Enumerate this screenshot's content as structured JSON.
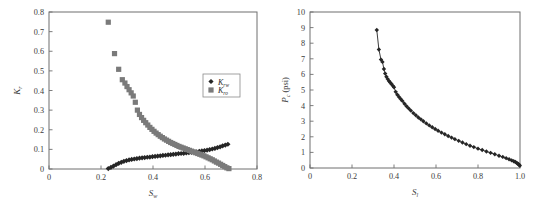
{
  "figure": {
    "background_color": "#ffffff",
    "panel_count": 2
  },
  "chart_data": [
    {
      "panel": "left",
      "type": "scatter",
      "title": "",
      "xlabel": "S_w",
      "xlabel_base": "S",
      "xlabel_sub": "w",
      "ylabel": "K_r",
      "ylabel_base": "K",
      "ylabel_sub": "r",
      "xlim": [
        0,
        0.8
      ],
      "ylim": [
        0,
        0.8
      ],
      "xticks": [
        0,
        0.2,
        0.4,
        0.6,
        0.8
      ],
      "xtick_labels": [
        "0",
        "0.2",
        "0.4",
        "0.6",
        "0.8"
      ],
      "yticks": [
        0,
        0.1,
        0.2,
        0.3,
        0.4,
        0.5,
        0.6,
        0.7,
        0.8
      ],
      "ytick_labels": [
        "0",
        "0.1",
        "0.2",
        "0.3",
        "0.4",
        "0.5",
        "0.6",
        "0.7",
        "0.8"
      ],
      "grid": false,
      "legend_position": "center-right",
      "series": [
        {
          "name": "K_rw",
          "name_base": "K",
          "name_sub": "rw",
          "marker": "diamond",
          "color": "#262626",
          "marker_size": 2.6,
          "x": [
            0.228,
            0.238,
            0.248,
            0.258,
            0.268,
            0.278,
            0.288,
            0.298,
            0.308,
            0.318,
            0.328,
            0.338,
            0.348,
            0.358,
            0.368,
            0.378,
            0.388,
            0.398,
            0.408,
            0.418,
            0.428,
            0.438,
            0.448,
            0.458,
            0.468,
            0.478,
            0.488,
            0.498,
            0.508,
            0.518,
            0.528,
            0.538,
            0.548,
            0.558,
            0.568,
            0.578,
            0.588,
            0.598,
            0.608,
            0.618,
            0.628,
            0.638,
            0.648,
            0.658,
            0.668,
            0.678,
            0.688
          ],
          "y": [
            0.002,
            0.008,
            0.015,
            0.022,
            0.029,
            0.034,
            0.039,
            0.043,
            0.046,
            0.049,
            0.051,
            0.053,
            0.055,
            0.057,
            0.058,
            0.06,
            0.061,
            0.063,
            0.064,
            0.066,
            0.067,
            0.069,
            0.07,
            0.072,
            0.073,
            0.075,
            0.076,
            0.078,
            0.079,
            0.08,
            0.082,
            0.083,
            0.085,
            0.086,
            0.088,
            0.09,
            0.092,
            0.094,
            0.096,
            0.099,
            0.102,
            0.105,
            0.109,
            0.113,
            0.118,
            0.122,
            0.126
          ]
        },
        {
          "name": "K_ro",
          "name_base": "K",
          "name_sub": "ro",
          "marker": "square",
          "color": "#7a7a7a",
          "marker_size": 2.6,
          "x": [
            0.228,
            0.252,
            0.268,
            0.282,
            0.292,
            0.3,
            0.308,
            0.316,
            0.324,
            0.332,
            0.34,
            0.348,
            0.356,
            0.364,
            0.372,
            0.38,
            0.388,
            0.396,
            0.404,
            0.412,
            0.42,
            0.428,
            0.436,
            0.444,
            0.452,
            0.46,
            0.468,
            0.476,
            0.484,
            0.492,
            0.5,
            0.508,
            0.516,
            0.524,
            0.532,
            0.54,
            0.548,
            0.556,
            0.564,
            0.572,
            0.58,
            0.588,
            0.596,
            0.604,
            0.612,
            0.62,
            0.628,
            0.636,
            0.644,
            0.652,
            0.66,
            0.668,
            0.676,
            0.684,
            0.692
          ],
          "y": [
            0.748,
            0.588,
            0.508,
            0.455,
            0.438,
            0.42,
            0.404,
            0.388,
            0.372,
            0.34,
            0.3,
            0.278,
            0.262,
            0.248,
            0.236,
            0.224,
            0.212,
            0.202,
            0.192,
            0.183,
            0.175,
            0.167,
            0.16,
            0.153,
            0.147,
            0.141,
            0.135,
            0.13,
            0.125,
            0.12,
            0.115,
            0.111,
            0.107,
            0.103,
            0.099,
            0.095,
            0.091,
            0.087,
            0.083,
            0.079,
            0.075,
            0.071,
            0.067,
            0.062,
            0.057,
            0.052,
            0.047,
            0.041,
            0.035,
            0.03,
            0.024,
            0.018,
            0.012,
            0.006,
            0.002
          ]
        }
      ]
    },
    {
      "panel": "right",
      "type": "line",
      "title": "",
      "xlabel": "S_l",
      "xlabel_base": "S",
      "xlabel_sub": "l",
      "ylabel": "P_c (psi)",
      "ylabel_base": "P",
      "ylabel_sub": "c",
      "ylabel_unit": "(psi)",
      "xlim": [
        0,
        1.0
      ],
      "ylim": [
        0,
        10
      ],
      "xticks": [
        0,
        0.2,
        0.4,
        0.6,
        0.8,
        1.0
      ],
      "xtick_labels": [
        "0",
        "0.2",
        "0.4",
        "0.6",
        "0.8",
        "1.0"
      ],
      "yticks": [
        0,
        1,
        2,
        3,
        4,
        5,
        6,
        7,
        8,
        9,
        10
      ],
      "ytick_labels": [
        "0",
        "1",
        "2",
        "3",
        "4",
        "5",
        "6",
        "7",
        "8",
        "9",
        "10"
      ],
      "grid": false,
      "legend_position": "none",
      "series": [
        {
          "name": "Pc",
          "marker": "diamond",
          "color": "#262626",
          "marker_size": 2.2,
          "line": true,
          "x": [
            0.318,
            0.328,
            0.338,
            0.345,
            0.352,
            0.358,
            0.364,
            0.37,
            0.376,
            0.382,
            0.388,
            0.394,
            0.4,
            0.408,
            0.416,
            0.424,
            0.432,
            0.44,
            0.45,
            0.46,
            0.47,
            0.48,
            0.492,
            0.504,
            0.516,
            0.528,
            0.54,
            0.554,
            0.568,
            0.582,
            0.596,
            0.61,
            0.626,
            0.642,
            0.658,
            0.674,
            0.69,
            0.708,
            0.726,
            0.744,
            0.762,
            0.78,
            0.8,
            0.82,
            0.84,
            0.86,
            0.88,
            0.9,
            0.918,
            0.934,
            0.948,
            0.96,
            0.97,
            0.978,
            0.985,
            0.99,
            0.994,
            0.997,
            0.999
          ],
          "y": [
            8.85,
            7.6,
            6.95,
            6.8,
            6.35,
            6.05,
            5.85,
            5.7,
            5.58,
            5.48,
            5.38,
            5.28,
            5.18,
            4.88,
            4.7,
            4.55,
            4.42,
            4.3,
            4.12,
            3.96,
            3.82,
            3.68,
            3.52,
            3.38,
            3.24,
            3.12,
            3.0,
            2.86,
            2.73,
            2.61,
            2.5,
            2.39,
            2.27,
            2.16,
            2.05,
            1.95,
            1.85,
            1.74,
            1.63,
            1.53,
            1.43,
            1.34,
            1.24,
            1.15,
            1.06,
            0.97,
            0.88,
            0.79,
            0.71,
            0.63,
            0.56,
            0.49,
            0.43,
            0.38,
            0.32,
            0.27,
            0.23,
            0.19,
            0.15
          ]
        }
      ]
    }
  ]
}
